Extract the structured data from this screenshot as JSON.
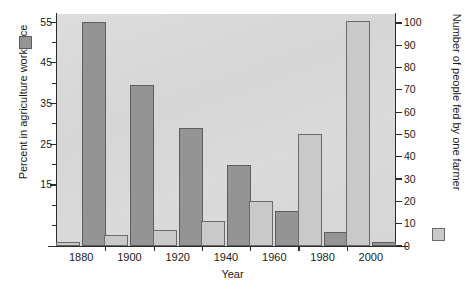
{
  "chart_data": {
    "type": "bar",
    "title": "",
    "subtitle": "",
    "xlabel": "Year",
    "categories": [
      "1880",
      "1900",
      "1920",
      "1940",
      "1960",
      "1980",
      "2000"
    ],
    "grid": false,
    "legend_position": "axis-swatches",
    "axes": {
      "left": {
        "label": "Percent in agriculture workforce",
        "ticks": [
          "55",
          "45",
          "35",
          "25",
          "15"
        ],
        "tick_values": [
          55,
          45,
          35,
          25,
          15
        ],
        "minor_tick_values": [
          50,
          40,
          30,
          20,
          10,
          5
        ],
        "range": [
          0,
          57
        ]
      },
      "right": {
        "label": "Number of people fed by one farmer",
        "ticks": [
          "0",
          "10",
          "20",
          "30",
          "40",
          "50",
          "60",
          "70",
          "80",
          "90",
          "100"
        ],
        "tick_values": [
          0,
          10,
          20,
          30,
          40,
          50,
          60,
          70,
          80,
          90,
          100
        ],
        "range": [
          0,
          104
        ]
      }
    },
    "series": [
      {
        "name": "Number of people fed by one farmer",
        "axis": "right",
        "color": "#c9c9c9",
        "values": [
          2,
          5,
          7,
          11,
          20,
          50,
          101
        ]
      },
      {
        "name": "Percent in agriculture workforce",
        "axis": "left",
        "color": "#949494",
        "values": [
          55,
          39.5,
          29,
          20,
          8.5,
          3.5,
          1
        ]
      }
    ],
    "colors": {
      "plot_background": "#d6d6d6",
      "page_background": "#ffffff",
      "axis": "#2b2b2b",
      "bar_light": "#c9c9c9",
      "bar_dark": "#949494",
      "text": "#1a1a1a"
    }
  }
}
